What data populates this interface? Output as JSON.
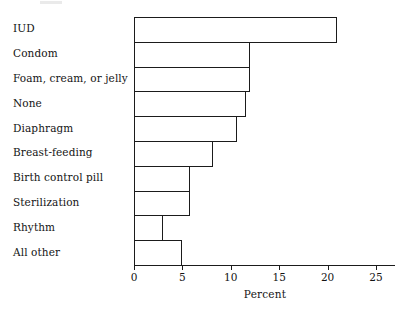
{
  "chart_data": {
    "type": "bar",
    "orientation": "horizontal",
    "title": "",
    "xlabel": "Percent",
    "ylabel": "",
    "categories": [
      "IUD",
      "Condom",
      "Foam, cream, or jelly",
      "None",
      "Diaphragm",
      "Breast-feeding",
      "Birth control pill",
      "Sterilization",
      "Rhythm",
      "All other"
    ],
    "values": [
      21.0,
      12.0,
      12.0,
      11.6,
      10.6,
      8.2,
      5.8,
      5.8,
      3.0,
      5.0
    ],
    "xlim": [
      0,
      27
    ],
    "xticks": [
      0,
      5,
      10,
      15,
      20,
      25
    ],
    "xtick_labels": [
      "0",
      "5",
      "10",
      "15",
      "20",
      "25"
    ],
    "grid": false,
    "legend": false,
    "bar_fill_color": "#ffffff",
    "bar_edge_color": "#1b1b1b",
    "axis_color": "#1b1b1b"
  },
  "axis": {
    "title": "Percent"
  }
}
